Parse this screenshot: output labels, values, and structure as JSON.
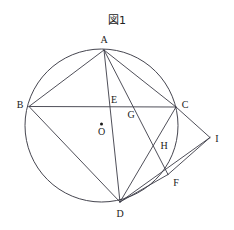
{
  "figure": {
    "title": "図1",
    "caption_position": "top-center"
  },
  "geometry": {
    "canvas": {
      "width": 234,
      "height": 230
    },
    "circle": {
      "cx": 101.5,
      "cy": 125.5,
      "r": 76.5,
      "name": "circumcircle"
    },
    "center": {
      "label": "O",
      "x": 101.5,
      "y": 124.0,
      "dot_radius": 1.5
    },
    "points": [
      {
        "id": "A",
        "label": "A",
        "x": 104.0,
        "y": 50.0,
        "label_x": 104.0,
        "label_y": 40.0,
        "on_circle": true
      },
      {
        "id": "B",
        "label": "B",
        "x": 29.0,
        "y": 106.5,
        "label_x": 20.0,
        "label_y": 105.0,
        "on_circle": true
      },
      {
        "id": "C",
        "label": "C",
        "x": 176.0,
        "y": 107.0,
        "label_x": 185.0,
        "label_y": 105.0,
        "on_circle": true
      },
      {
        "id": "D",
        "label": "D",
        "x": 120.0,
        "y": 202.0,
        "label_x": 120.0,
        "label_y": 214.0,
        "on_circle": true
      },
      {
        "id": "F",
        "label": "F",
        "x": 168.0,
        "y": 174.5,
        "label_x": 176.0,
        "label_y": 183.0,
        "on_circle": true
      },
      {
        "id": "E",
        "label": "E",
        "x": 108.5,
        "y": 107.0,
        "label_x": 114.0,
        "label_y": 100.0,
        "on_circle": false
      },
      {
        "id": "G",
        "label": "G",
        "x": 126.5,
        "y": 107.0,
        "label_x": 131.0,
        "label_y": 115.0,
        "on_circle": false
      },
      {
        "id": "H",
        "label": "H",
        "x": 156.5,
        "y": 150.0,
        "label_x": 164.0,
        "label_y": 146.0,
        "on_circle": false
      },
      {
        "id": "I",
        "label": "I",
        "x": 210.0,
        "y": 137.5,
        "label_x": 217.0,
        "label_y": 139.0,
        "on_circle": false
      }
    ],
    "segments": [
      {
        "name": "segment-AB",
        "from": "A",
        "to": "B"
      },
      {
        "name": "segment-AC",
        "from": "A",
        "to": "C"
      },
      {
        "name": "segment-AD",
        "from": "A",
        "to": "D"
      },
      {
        "name": "segment-AF",
        "from": "A",
        "to": "F"
      },
      {
        "name": "segment-BC",
        "from": "B",
        "to": "C"
      },
      {
        "name": "segment-BD",
        "from": "B",
        "to": "D"
      },
      {
        "name": "segment-CD",
        "from": "C",
        "to": "D"
      },
      {
        "name": "segment-DF",
        "from": "D",
        "to": "F"
      },
      {
        "name": "segment-CI",
        "from": "C",
        "to": "I"
      },
      {
        "name": "segment-FI",
        "from": "F",
        "to": "I"
      },
      {
        "name": "segment-DI-partial",
        "from": "D",
        "to": "I"
      }
    ]
  }
}
